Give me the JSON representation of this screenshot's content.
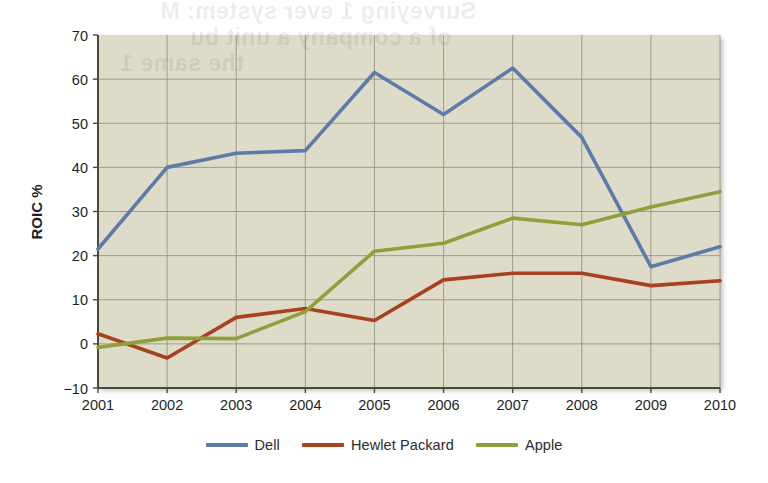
{
  "chart_data": {
    "type": "line",
    "title": "",
    "subtitle": "",
    "xlabel": "",
    "ylabel": "ROIC %",
    "categories": [
      "2001",
      "2002",
      "2003",
      "2004",
      "2005",
      "2006",
      "2007",
      "2008",
      "2009",
      "2010"
    ],
    "x": [
      2001,
      2002,
      2003,
      2004,
      2005,
      2006,
      2007,
      2008,
      2009,
      2010
    ],
    "xlim": [
      2001,
      2010
    ],
    "ylim": [
      -10,
      70
    ],
    "yticks": [
      -10,
      0,
      10,
      20,
      30,
      40,
      50,
      60,
      70
    ],
    "ytick_labels": [
      "−10",
      "0",
      "10",
      "20",
      "30",
      "40",
      "50",
      "60",
      "70"
    ],
    "grid": true,
    "legend_position": "bottom-center",
    "series": [
      {
        "name": "Dell",
        "color": "#5b7bab",
        "values": [
          21.5,
          40.0,
          43.2,
          43.8,
          61.5,
          52.0,
          62.5,
          46.8,
          17.5,
          22.0
        ]
      },
      {
        "name": "Hewlet Packard",
        "color": "#a8411d",
        "values": [
          2.3,
          -3.2,
          6.0,
          8.0,
          5.3,
          14.5,
          16.0,
          16.0,
          13.2,
          14.3
        ]
      },
      {
        "name": "Apple",
        "color": "#8fa03a",
        "values": [
          -0.8,
          1.3,
          1.2,
          7.3,
          21.0,
          22.8,
          28.5,
          27.0,
          31.0,
          34.5
        ]
      }
    ]
  },
  "legend": {
    "items": [
      {
        "label": "Dell",
        "color": "#5b7bab"
      },
      {
        "label": "Hewlet Packard",
        "color": "#a8411d"
      },
      {
        "label": "Apple",
        "color": "#8fa03a"
      }
    ]
  },
  "axes": {
    "y_axis_title": "ROIC %"
  },
  "style": {
    "plot_background": "#dedbc8",
    "page_background": "#ffffff",
    "gridline_color": "#8a8878",
    "axis_color": "#4a4a42",
    "tick_text_color": "#1f1f1f"
  },
  "bleed_through": {
    "line1": "Surveying 1 ever system:  M",
    "line2": "of a company a  unit bu",
    "line3": "the same 1"
  }
}
